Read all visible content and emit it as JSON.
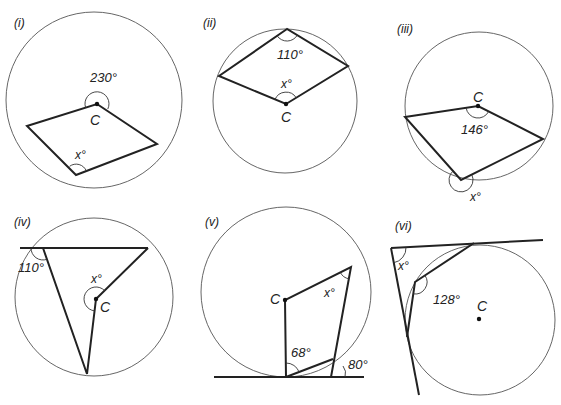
{
  "diagrams": [
    {
      "id": "i",
      "label": "(i)",
      "center_label": "C",
      "given_angle": "230°",
      "unknown_angle": "x°",
      "description": "Reflex angle 230° at centre C; inscribed angle x° at circumference on opposite arc"
    },
    {
      "id": "ii",
      "label": "(ii)",
      "center_label": "C",
      "given_angle": "110°",
      "unknown_angle": "x°",
      "description": "Inscribed angle 110° at top vertex; angle x° at centre C"
    },
    {
      "id": "iii",
      "label": "(iii)",
      "center_label": "C",
      "given_angle": "146°",
      "unknown_angle": "x°",
      "description": "Angle 146° at centre C; reflex angle x° at vertex on circumference"
    },
    {
      "id": "iv",
      "label": "(iv)",
      "center_label": "C",
      "given_angle": "110°",
      "unknown_angle": "x°",
      "description": "Exterior angle 110° on extended chord; reflex angle x° at centre C"
    },
    {
      "id": "v",
      "label": "(v)",
      "center_label": "C",
      "given_angles": [
        "68°",
        "80°"
      ],
      "unknown_angle": "x°",
      "description": "Tangent line at bottom; angles 68° and 80° marked; angle x° at upper vertex"
    },
    {
      "id": "vi",
      "label": "(vi)",
      "center_label": "C",
      "given_angle": "128°",
      "unknown_angle": "x°",
      "description": "Two tangents meet at x°; inscribed angle 128° between chords from tangent points"
    }
  ]
}
